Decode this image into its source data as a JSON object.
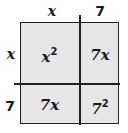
{
  "diagram": {
    "top_labels": [
      "x",
      "7"
    ],
    "left_labels": [
      "x",
      "7"
    ],
    "cells": [
      {
        "base": "x",
        "exponent": "2",
        "label": "x²"
      },
      {
        "base": "7x",
        "exponent": "",
        "label": "7x"
      },
      {
        "base": "7x",
        "exponent": "",
        "label": "7x"
      },
      {
        "base": "7",
        "exponent": "2",
        "label": "7²"
      }
    ],
    "colors": {
      "cell_fill": "#e6e6e6",
      "line": "#222222",
      "text": "#1a1a1a",
      "background": "#ffffff"
    }
  }
}
